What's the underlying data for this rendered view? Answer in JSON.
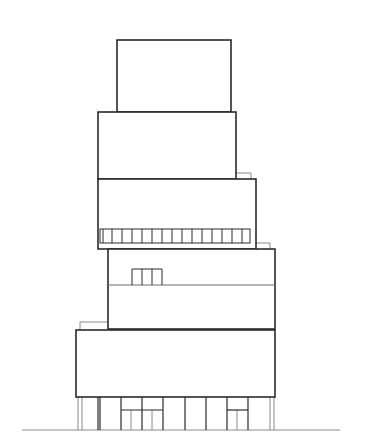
{
  "drawing": {
    "type": "architectural-elevation",
    "colors": {
      "background": "#ffffff",
      "main_line": "#2a2a2a",
      "secondary_line": "#8a8a8a"
    },
    "volumes": [
      {
        "name": "volume-1-top",
        "x": 117,
        "y": 40,
        "w": 114,
        "h": 72
      },
      {
        "name": "volume-2",
        "x": 98,
        "y": 112,
        "w": 138,
        "h": 67
      },
      {
        "name": "volume-3",
        "x": 98,
        "y": 179,
        "w": 158,
        "h": 70
      },
      {
        "name": "volume-4",
        "x": 108,
        "y": 249,
        "w": 167,
        "h": 80
      },
      {
        "name": "volume-5-bottom",
        "x": 76,
        "y": 330,
        "w": 199,
        "h": 67
      }
    ],
    "window_strip": {
      "x": 100,
      "y": 229,
      "w": 150,
      "h": 14,
      "cells": 15
    },
    "small_windows": {
      "x": 132,
      "y": 269,
      "w": 30,
      "h": 16,
      "cells": 3
    },
    "ground_line": {
      "x1": 22,
      "x2": 340,
      "y": 430
    }
  }
}
